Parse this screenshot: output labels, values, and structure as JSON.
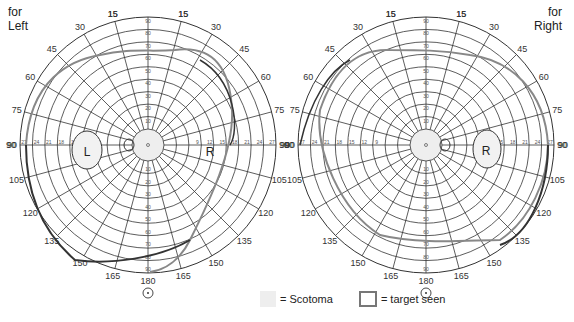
{
  "chart_data": [
    {
      "type": "polar-perimetry",
      "title": "for Left",
      "eye": "Left",
      "meridian_labels": [
        15,
        30,
        45,
        60,
        75,
        90,
        105,
        120,
        135,
        150,
        165,
        180,
        165,
        150,
        135,
        120,
        105,
        90,
        75,
        60,
        45,
        30,
        15
      ],
      "radial_labels_vertical": [
        10,
        20,
        30,
        40,
        50,
        60,
        70,
        80,
        90
      ],
      "radial_labels_horizontal": [
        9,
        12,
        15,
        18,
        21,
        24,
        27
      ],
      "blind_spot_label": "L",
      "field_label_right": "R",
      "isopters": [
        "light-gray outer field boundary",
        "dark outer boundary"
      ],
      "legend": [
        "= Scotoma",
        "= target seen"
      ]
    },
    {
      "type": "polar-perimetry",
      "title": "for Right",
      "eye": "Right",
      "meridian_labels": [
        15,
        30,
        45,
        60,
        75,
        90,
        105,
        120,
        135,
        150,
        165,
        180,
        165,
        150,
        135,
        120,
        105,
        90,
        75,
        60,
        45,
        30,
        15
      ],
      "radial_labels_vertical": [
        10,
        20,
        30,
        40,
        50,
        60,
        70,
        80,
        90
      ],
      "radial_labels_horizontal": [
        9,
        12,
        15,
        18,
        21,
        24,
        27
      ],
      "blind_spot_label": "R",
      "isopters": [
        "light-gray outer field boundary",
        "dark outer boundary"
      ],
      "legend": [
        "= Scotoma",
        "= target seen"
      ]
    }
  ],
  "left": {
    "title_line1": "for",
    "title_line2": "Left",
    "spot": "L",
    "r_label": "R"
  },
  "right": {
    "title_line1": "for",
    "title_line2": "Right",
    "spot": "R"
  },
  "legend": {
    "scotoma": "= Scotoma",
    "seen": "= target seen"
  }
}
